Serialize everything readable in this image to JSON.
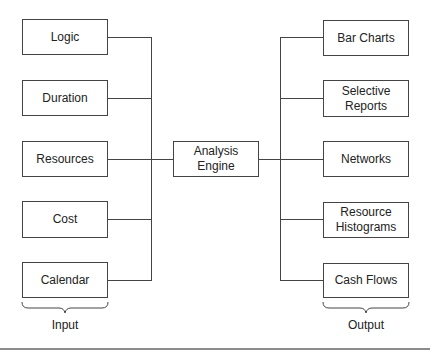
{
  "inputs": [
    {
      "label": "Logic"
    },
    {
      "label": "Duration"
    },
    {
      "label": "Resources"
    },
    {
      "label": "Cost"
    },
    {
      "label": "Calendar"
    }
  ],
  "engine": {
    "line1": "Analysis",
    "line2": "Engine"
  },
  "outputs": [
    {
      "line1": "Bar Charts",
      "line2": ""
    },
    {
      "line1": "Selective",
      "line2": "Reports"
    },
    {
      "line1": "Networks",
      "line2": ""
    },
    {
      "line1": "Resource",
      "line2": "Histograms"
    },
    {
      "line1": "Cash Flows",
      "line2": ""
    }
  ],
  "group_labels": {
    "input": "Input",
    "output": "Output"
  }
}
